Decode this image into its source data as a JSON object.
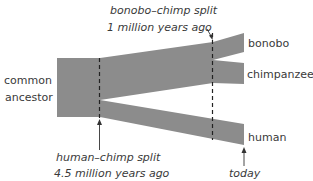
{
  "diagram": {
    "root_label_line1": "common",
    "root_label_line2": "ancestor",
    "leaves": [
      {
        "label": "bonobo"
      },
      {
        "label": "chimpanzee"
      },
      {
        "label": "human"
      }
    ],
    "events": {
      "bonobo_chimp_split": {
        "line1": "bonobo–chimp split",
        "line2": "1 million years ago"
      },
      "human_chimp_split": {
        "line1": "human–chimp split",
        "line2": "4.5 million years ago"
      },
      "today": {
        "label": "today"
      }
    },
    "colors": {
      "branch_fill": "#8c8c8c",
      "text": "#3a3a3a",
      "lines": "#222222"
    }
  }
}
